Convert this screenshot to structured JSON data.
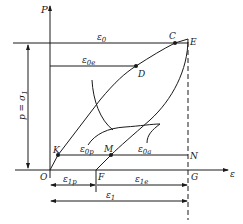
{
  "diagram": {
    "type": "stress-strain loading-unloading diagram",
    "axes": {
      "y_label": "P",
      "x_label": "ε"
    },
    "points": {
      "O": "O",
      "K": "K",
      "M": "M",
      "N": "N",
      "F": "F",
      "G": "G",
      "C": "C",
      "D": "D",
      "E": "E"
    },
    "strain_labels": {
      "eps0": {
        "base": "ε",
        "sub": "0"
      },
      "eps0e": {
        "base": "ε",
        "sub": "0e"
      },
      "eps0p": {
        "base": "ε",
        "sub": "0p"
      },
      "eps0a": {
        "base": "ε",
        "sub": "0a"
      },
      "eps1p": {
        "base": "ε",
        "sub": "1p"
      },
      "eps1e": {
        "base": "ε",
        "sub": "1e"
      },
      "eps1": {
        "base": "ε",
        "sub": "1"
      }
    },
    "stress_label": {
      "base": "p = σ",
      "sub": "1"
    },
    "colors": {
      "line": "#1a1a1a",
      "background": "#ffffff"
    }
  }
}
